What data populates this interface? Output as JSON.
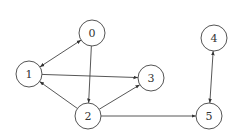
{
  "graph": {
    "directed": true,
    "node_radius": 13,
    "nodes": [
      {
        "id": "0",
        "label": "0",
        "x": 92,
        "y": 33
      },
      {
        "id": "1",
        "label": "1",
        "x": 29,
        "y": 74
      },
      {
        "id": "2",
        "label": "2",
        "x": 88,
        "y": 116
      },
      {
        "id": "3",
        "label": "3",
        "x": 151,
        "y": 78
      },
      {
        "id": "4",
        "label": "4",
        "x": 214,
        "y": 38
      },
      {
        "id": "5",
        "label": "5",
        "x": 209,
        "y": 116
      }
    ],
    "edges": [
      {
        "from": "1",
        "to": "0",
        "bidirectional": true
      },
      {
        "from": "0",
        "to": "2",
        "bidirectional": false
      },
      {
        "from": "2",
        "to": "1",
        "bidirectional": false
      },
      {
        "from": "1",
        "to": "3",
        "bidirectional": false
      },
      {
        "from": "2",
        "to": "3",
        "bidirectional": false
      },
      {
        "from": "2",
        "to": "5",
        "bidirectional": false
      },
      {
        "from": "4",
        "to": "5",
        "bidirectional": true
      }
    ],
    "colors": {
      "stroke": "#444444",
      "node_fill": "#ffffff",
      "label": "#333333"
    }
  }
}
